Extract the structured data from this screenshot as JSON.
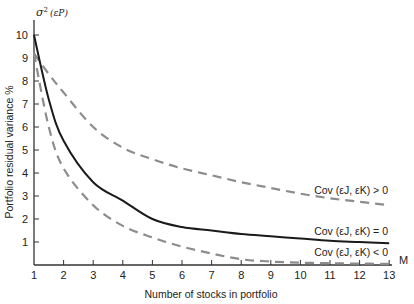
{
  "chart_data": {
    "type": "line",
    "title": "",
    "xlabel": "Number of stocks in portfolio",
    "ylabel": "Portfolio residual variance  %",
    "y_symbol": "σ²(εP)",
    "x_axis_end_label": "M",
    "xlim": [
      1,
      13
    ],
    "ylim": [
      0,
      10
    ],
    "grid": false,
    "x_ticks": [
      1,
      2,
      3,
      4,
      5,
      6,
      7,
      8,
      9,
      10,
      11,
      12,
      13
    ],
    "y_ticks": [
      1,
      2,
      3,
      4,
      5,
      6,
      7,
      8,
      9,
      10
    ],
    "x": [
      1,
      1.5,
      2,
      3,
      4,
      5,
      6,
      7,
      8,
      9,
      10,
      11,
      12,
      13
    ],
    "series": [
      {
        "name": "Cov (εJ, εK) > 0",
        "style": "dashed",
        "color": "#8c8c8c",
        "values": [
          9.2,
          8.3,
          7.5,
          6.0,
          5.1,
          4.6,
          4.2,
          3.9,
          3.6,
          3.35,
          3.1,
          2.9,
          2.75,
          2.6
        ]
      },
      {
        "name": "Cov (εJ, εK) = 0",
        "style": "solid",
        "color": "#1a1a1a",
        "values": [
          10.0,
          7.2,
          5.4,
          3.6,
          2.8,
          2.0,
          1.65,
          1.5,
          1.35,
          1.25,
          1.15,
          1.05,
          1.0,
          0.95
        ]
      },
      {
        "name": "Cov (εJ, εK) < 0",
        "style": "dashed",
        "color": "#8c8c8c",
        "values": [
          9.2,
          6.0,
          4.2,
          2.6,
          1.7,
          1.2,
          0.8,
          0.5,
          0.25,
          0.15,
          0.1,
          0.08,
          0.06,
          0.05
        ]
      }
    ],
    "legend_position": "inline labels at right end of each curve"
  },
  "labels": {
    "y_symbol_sigma": "σ",
    "y_symbol_sup": "2",
    "y_symbol_arg": "(εP)",
    "ylabel": "Portfolio residual variance  %",
    "xlabel": "Number of stocks in portfolio",
    "x_end": "M",
    "curve_pos": "Cov (εJ, εK) > 0",
    "curve_zero": "Cov (εJ, εK) = 0",
    "curve_neg": "Cov (εJ, εK) < 0"
  }
}
